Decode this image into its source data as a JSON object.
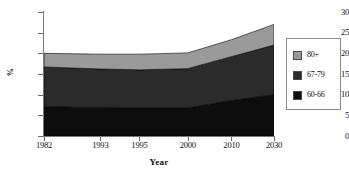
{
  "chart_data": {
    "type": "area",
    "stacked": true,
    "title": "",
    "xlabel": "Year",
    "ylabel": "%",
    "categories": [
      "1982",
      "1993",
      "1995",
      "2000",
      "2010",
      "2030"
    ],
    "x_positions_pct": [
      0,
      24.5,
      41.5,
      62.5,
      81.5,
      100
    ],
    "ylim": [
      0,
      30
    ],
    "yticks": [
      0,
      5,
      10,
      15,
      20,
      25,
      30
    ],
    "ytick_labels": [
      "0",
      "5",
      "10",
      "15",
      "20",
      "25",
      "30"
    ],
    "grid": false,
    "legend_position": "right",
    "series": [
      {
        "name": "60-66",
        "color": "#0d0d0d",
        "values": [
          7.1,
          6.9,
          6.8,
          6.8,
          8.6,
          10.0
        ]
      },
      {
        "name": "67-79",
        "color": "#2b2b2b",
        "values": [
          9.6,
          9.3,
          9.2,
          9.5,
          10.6,
          12.0
        ]
      },
      {
        "name": "80+",
        "color": "#9a9a9a",
        "values": [
          3.3,
          3.6,
          3.8,
          3.8,
          4.1,
          5.0
        ]
      }
    ],
    "cumulative_tops": {
      "60-66": [
        7.1,
        6.9,
        6.8,
        6.8,
        8.6,
        10.0
      ],
      "67-79": [
        16.7,
        16.2,
        16.0,
        16.3,
        19.2,
        22.0
      ],
      "80+": [
        20.0,
        19.8,
        19.8,
        20.1,
        23.3,
        27.0
      ]
    }
  },
  "legend": {
    "items": [
      {
        "label": "80+",
        "color": "#9a9a9a"
      },
      {
        "label": "67-79",
        "color": "#2b2b2b"
      },
      {
        "label": "60-66",
        "color": "#0d0d0d"
      }
    ]
  },
  "axes": {
    "y_title": "%",
    "x_title": "Year"
  }
}
